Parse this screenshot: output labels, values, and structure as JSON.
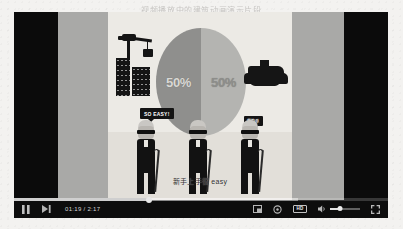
{
  "page": {
    "header_text": "视频播放中的建筑动画演示片段"
  },
  "player": {
    "state": "playing",
    "time_display": "01:19 / 2:17",
    "progress_percent": 36,
    "buffered_percent": 76,
    "volume_percent": 34,
    "quality_badge": "HD",
    "controls": {
      "pause": "Pause",
      "next": "Next video",
      "miniplayer": "Miniplayer",
      "settings": "Settings",
      "quality": "HD",
      "mute": "Mute",
      "volume": "Volume",
      "fullscreen": "Full screen"
    }
  },
  "video": {
    "subtitle": "新手上手很 easy",
    "chart_data": {
      "type": "pie",
      "title": "",
      "labels": [
        "50%",
        "50%"
      ],
      "values": [
        50,
        50
      ],
      "colors": [
        "#8f8f8d",
        "#b4b4b1"
      ]
    },
    "pie_left_label": "50%",
    "pie_right_label": "50%",
    "speech_bubbles": [
      {
        "text": "SO EASY!"
      },
      {
        "text": "很简单"
      }
    ],
    "scene_objects": {
      "crane": "construction-crane",
      "buildings": "building-blocks",
      "rock": "rock-pile",
      "characters": [
        "old-man-1",
        "old-man-2",
        "old-man-3"
      ]
    }
  }
}
